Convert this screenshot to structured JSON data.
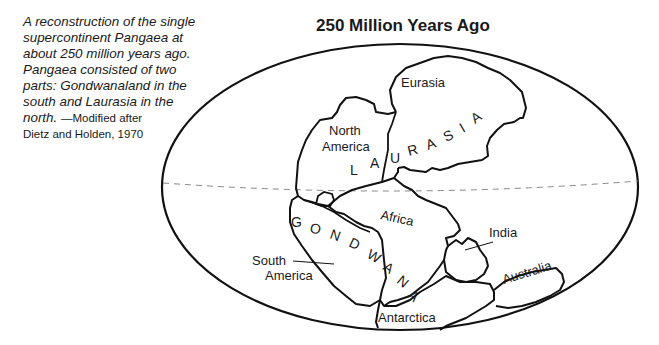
{
  "caption": {
    "text": "A reconstruction of the single supercontinent Pangaea at about 250 million years ago. Pangaea consisted of two parts: Gondwanaland in the south and Laurasia in the north.",
    "lines": [
      "A reconstruction of the single",
      "supercontinent Pangaea at",
      "about 250 million years ago.",
      "Pangaea consisted of two",
      "parts: Gondwanaland in the",
      "south and Laurasia in the",
      "north."
    ],
    "credit_a": "—Modified after",
    "credit_b": "Dietz and Holden, 1970"
  },
  "title": "250 Million Years Ago",
  "map": {
    "supercontinent_labels": {
      "laurasia": [
        "L",
        "A",
        "U",
        "R",
        "A",
        "S",
        "I",
        "A"
      ],
      "gondwana": [
        "G",
        "O",
        "N",
        "D",
        "W",
        "A",
        "N",
        "A"
      ]
    },
    "continents": {
      "eurasia": "Eurasia",
      "north_america_1": "North",
      "north_america_2": "America",
      "africa": "Africa",
      "south_america_1": "South",
      "south_america_2": "America",
      "india": "India",
      "australia": "Australia",
      "antarctica": "Antarctica"
    },
    "colors": {
      "outline": "#111111",
      "equator": "#888888",
      "background": "#ffffff"
    }
  }
}
